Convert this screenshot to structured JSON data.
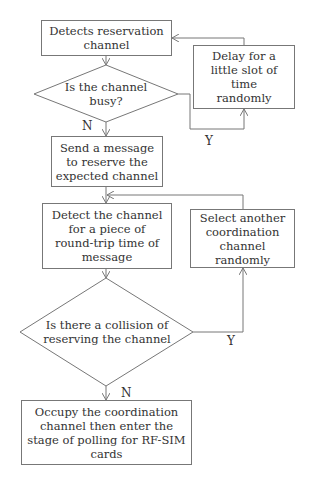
{
  "flowchart": {
    "nodes": [
      {
        "id": "detect_reservation",
        "type": "process",
        "text": "Detects reservation channel"
      },
      {
        "id": "channel_busy",
        "type": "decision",
        "text": "Is the channel busy?"
      },
      {
        "id": "delay",
        "type": "process",
        "text": "Delay for a little slot of time randomly"
      },
      {
        "id": "send_message",
        "type": "process",
        "text": "Send a message to reserve the expected channel"
      },
      {
        "id": "detect_rtt",
        "type": "process",
        "text": "Detect the channel for a piece of round-trip time of message"
      },
      {
        "id": "collision",
        "type": "decision",
        "text": "Is there a collision of reserving the channel"
      },
      {
        "id": "select_another",
        "type": "process",
        "text": "Select another coordination channel randomly"
      },
      {
        "id": "occupy",
        "type": "process",
        "text": "Occupy the coordination channel then enter the stage of polling for RF-SIM cards"
      }
    ],
    "edges": [
      {
        "from": "detect_reservation",
        "to": "channel_busy",
        "label": ""
      },
      {
        "from": "channel_busy",
        "to": "delay",
        "label": "Y"
      },
      {
        "from": "delay",
        "to": "detect_reservation",
        "label": ""
      },
      {
        "from": "channel_busy",
        "to": "send_message",
        "label": "N"
      },
      {
        "from": "send_message",
        "to": "detect_rtt",
        "label": ""
      },
      {
        "from": "detect_rtt",
        "to": "collision",
        "label": ""
      },
      {
        "from": "collision",
        "to": "select_another",
        "label": "Y"
      },
      {
        "from": "select_another",
        "to": "detect_rtt",
        "label": ""
      },
      {
        "from": "collision",
        "to": "occupy",
        "label": "N"
      }
    ],
    "labels": {
      "busy_no": "N",
      "busy_yes": "Y",
      "collision_no": "N",
      "collision_yes": "Y"
    }
  }
}
